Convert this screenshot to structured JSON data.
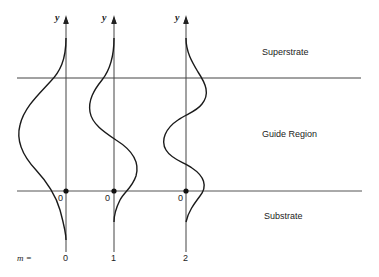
{
  "regions": {
    "superstrate": "Superstrate",
    "guide": "Guide Region",
    "substrate": "Substrate"
  },
  "axis_label": "y",
  "origin_label": "0",
  "mode_prefix": "m =",
  "modes": [
    {
      "m": "0",
      "axis_x": 66
    },
    {
      "m": "1",
      "axis_x": 114
    },
    {
      "m": "2",
      "axis_x": 186
    }
  ],
  "boundaries": {
    "superstrate_y": 78,
    "substrate_y": 191
  },
  "colors": {
    "ink": "#222222",
    "line": "#555555"
  }
}
